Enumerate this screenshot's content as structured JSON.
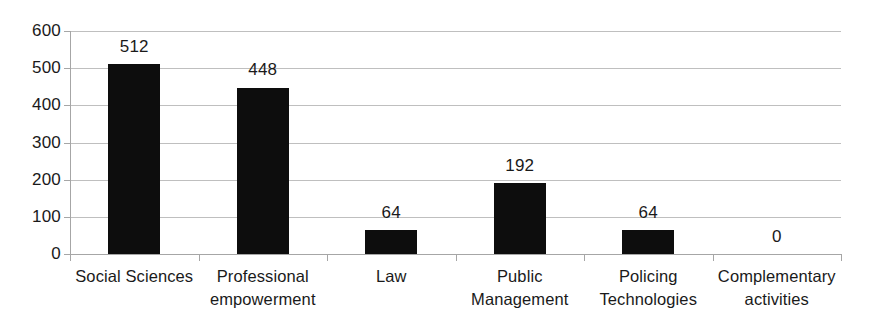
{
  "chart_data": {
    "type": "bar",
    "title": "",
    "xlabel": "",
    "ylabel": "",
    "categories": [
      "Social Sciences",
      "Professional empowerment",
      "Law",
      "Public Management",
      "Policing Technologies",
      "Complementary activities"
    ],
    "category_lines": [
      [
        "Social Sciences"
      ],
      [
        "Professional",
        "empowerment"
      ],
      [
        "Law"
      ],
      [
        "Public",
        "Management"
      ],
      [
        "Policing",
        "Technologies"
      ],
      [
        "Complementary",
        "activities"
      ]
    ],
    "values": [
      512,
      448,
      64,
      192,
      64,
      0
    ],
    "value_labels": [
      "512",
      "448",
      "64",
      "192",
      "64",
      "0"
    ],
    "ylim": [
      0,
      600
    ],
    "ytick_values": [
      600,
      500,
      400,
      300,
      200,
      100,
      0
    ],
    "ytick_labels": [
      "600",
      "500",
      "400",
      "300",
      "200",
      "100",
      "0"
    ],
    "grid": true,
    "legend": false,
    "legend_position": "none",
    "bar_color": "#0d0d0d",
    "gridline_color": "#bfbfbf",
    "axis_color": "#a6a6a6",
    "background_color": "#ffffff",
    "text_color": "#1a1a1a"
  }
}
